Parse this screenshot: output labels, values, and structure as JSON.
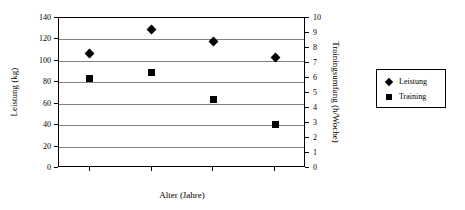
{
  "chart_data": {
    "type": "scatter",
    "title": "",
    "xlabel": "Alter (Jahre)",
    "ylabel": "Leistung (kg)",
    "ylabel_right": "Trainingsumfang (h/Woche)",
    "x": [
      20,
      30,
      40,
      50
    ],
    "xlim": [
      15,
      55
    ],
    "ylim": [
      0,
      140
    ],
    "ylim_right": [
      0,
      10
    ],
    "xticks": [
      "20",
      "30",
      "40",
      "50"
    ],
    "xtick_values": [
      20,
      30,
      40,
      50
    ],
    "yticks": [
      "0",
      "20",
      "40",
      "60",
      "80",
      "100",
      "120",
      "140"
    ],
    "ytick_values": [
      0,
      20,
      40,
      60,
      80,
      100,
      120,
      140
    ],
    "yticks_right": [
      "0",
      "1",
      "2",
      "3",
      "4",
      "5",
      "6",
      "7",
      "8",
      "9",
      "10"
    ],
    "ytick_right_values": [
      0,
      1,
      2,
      3,
      4,
      5,
      6,
      7,
      8,
      9,
      10
    ],
    "grid": "horizontal",
    "gridline_values": [
      20,
      40,
      60,
      80,
      100,
      120
    ],
    "legend_position": "right-outside",
    "series": [
      {
        "name": "Leistung",
        "axis": "left",
        "marker": "diamond",
        "color": "#000000",
        "values": [
          107,
          129,
          118,
          103
        ]
      },
      {
        "name": "Training",
        "axis": "right",
        "marker": "square",
        "color": "#000000",
        "values": [
          6.0,
          6.4,
          4.6,
          2.9
        ]
      }
    ]
  },
  "legend": {
    "entries": [
      {
        "label": "Leistung",
        "marker": "diamond"
      },
      {
        "label": "Training",
        "marker": "square"
      }
    ]
  },
  "colors": {
    "marker": "#000000",
    "axis": "#000000",
    "grid": "#808080",
    "background": "#ffffff"
  }
}
